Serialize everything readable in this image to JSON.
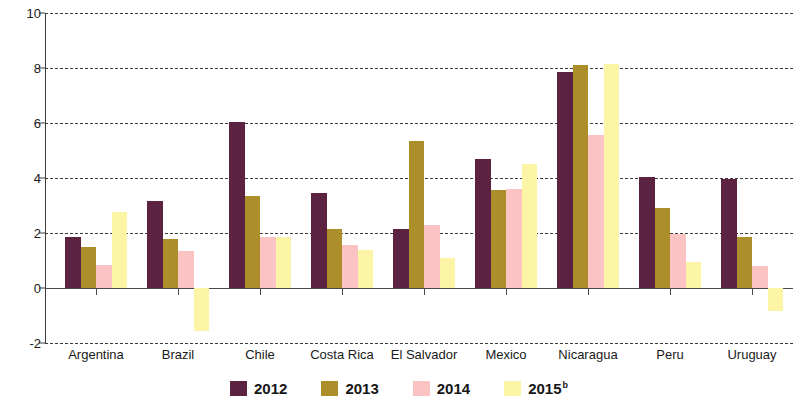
{
  "chart_data": {
    "type": "bar",
    "title": "",
    "subtitle": "",
    "xlabel": "",
    "ylabel": "",
    "ylim": [
      -2,
      10
    ],
    "yticks": [
      -2,
      0,
      2,
      4,
      6,
      8,
      10
    ],
    "ytick_labels": [
      "-2",
      "0",
      "2",
      "4",
      "6",
      "8",
      "10"
    ],
    "grid": "horizontal-dashed",
    "legend_position": "bottom-center",
    "categories": [
      "Argentina",
      "Brazil",
      "Chile",
      "Costa Rica",
      "El Salvador",
      "Mexico",
      "Nicaragua",
      "Peru",
      "Uruguay"
    ],
    "series": [
      {
        "name": "2012",
        "color": "#5b2341",
        "values": [
          1.85,
          3.15,
          6.05,
          3.45,
          2.15,
          4.7,
          7.85,
          4.05,
          3.95
        ]
      },
      {
        "name": "2013",
        "color": "#ac8f2b",
        "values": [
          1.5,
          1.8,
          3.35,
          2.15,
          5.35,
          3.55,
          8.1,
          2.9,
          1.85
        ]
      },
      {
        "name": "2014",
        "color": "#fbc3c3",
        "values": [
          0.85,
          1.35,
          1.85,
          1.55,
          2.3,
          3.6,
          5.55,
          1.95,
          0.8
        ]
      },
      {
        "name": "2015",
        "label_suffix": "b",
        "color": "#fcf5a6",
        "values": [
          2.75,
          -1.55,
          1.85,
          1.4,
          1.1,
          4.5,
          8.15,
          0.95,
          -0.85
        ]
      }
    ]
  },
  "legend": {
    "items": [
      {
        "label": "2012",
        "suffix": "",
        "color": "#5b2341"
      },
      {
        "label": "2013",
        "suffix": "",
        "color": "#ac8f2b"
      },
      {
        "label": "2014",
        "suffix": "",
        "color": "#fbc3c3"
      },
      {
        "label": "2015",
        "suffix": "b",
        "color": "#fcf5a6"
      }
    ]
  },
  "axis": {
    "y_tick_labels": [
      "10",
      "8",
      "6",
      "4",
      "2",
      "0",
      "-2"
    ],
    "x_tick_labels": [
      "Argentina",
      "Brazil",
      "Chile",
      "Costa Rica",
      "El Salvador",
      "Mexico",
      "Nicaragua",
      "Peru",
      "Uruguay"
    ]
  },
  "colors": {
    "axis": "#3c3c3c",
    "gridline": "#3c3c3c",
    "background": "#ffffff",
    "text": "#1a1a1a"
  }
}
